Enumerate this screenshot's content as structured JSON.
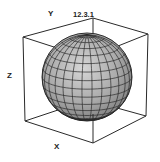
{
  "figure": {
    "label": "12.3.1"
  },
  "axes": {
    "x_label": "X",
    "y_label": "Y",
    "z_label": "Z"
  },
  "colors": {
    "box_line": "#2a2a2a",
    "sphere_fill": "#a8a8a8",
    "sphere_highlight": "#d4d4d4",
    "mesh_line": "#2b2b2b",
    "background": "#ffffff"
  },
  "sphere": {
    "center": [
      87,
      77
    ],
    "radius_x": 45,
    "radius_y": 44,
    "meridian_count": 14,
    "parallel_count": 16
  }
}
